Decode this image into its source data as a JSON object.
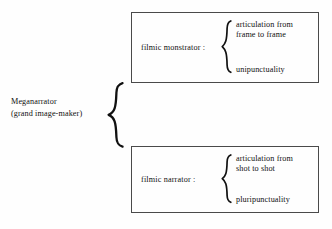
{
  "diagram": {
    "type": "tree-brace-diagram",
    "root": {
      "line1": "Meganarrator",
      "line2": "(grand image-maker)"
    },
    "branches": [
      {
        "id": "filmic-monstrator",
        "label": "filmic monstrator :",
        "attributes": {
          "articulation_line1": "articulation from",
          "articulation_line2": "frame to frame",
          "punctuality": "unipunctuality"
        }
      },
      {
        "id": "filmic-narrator",
        "label": "filmic narrator :",
        "attributes": {
          "articulation_line1": "articulation from",
          "articulation_line2": "shot to shot",
          "punctuality": "pluripunctuality"
        }
      }
    ],
    "colors": {
      "background": "#fefefe",
      "text": "#111111",
      "box_border": "#4a4a4a",
      "brace": "#111111"
    },
    "icons": {
      "root_connector": "curly-brace-icon",
      "branch_connector": "curly-brace-icon"
    }
  }
}
